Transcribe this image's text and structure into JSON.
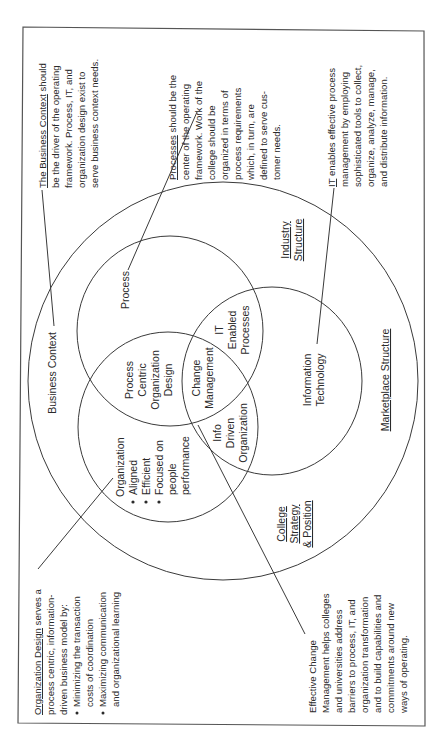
{
  "diagram": {
    "orientation": "rotated 90 degrees counter-clockwise (text reads bottom-to-top)",
    "colors": {
      "line": "#3a3a3a",
      "text": "#2a2a2a",
      "background": "#ffffff"
    },
    "regions": {
      "outer": {
        "label": "Business Context"
      },
      "process_circle": {
        "label": "Process"
      },
      "organization_circle": {
        "title": "Organization",
        "bullets": [
          "Aligned",
          "Efficient",
          "Focused on",
          "people",
          "performance"
        ]
      },
      "it_circle": {
        "line1": "Information",
        "line2": "Technology"
      },
      "process_org_overlap": {
        "lines": [
          "Process",
          "Centric",
          "Organization",
          "Design"
        ]
      },
      "process_it_overlap": {
        "lines": [
          "IT",
          "Enabled",
          "Processes"
        ]
      },
      "org_it_overlap": {
        "lines": [
          "Info",
          "Driven",
          "Organization"
        ]
      },
      "center_overlap": {
        "lines": [
          "Change",
          "Management"
        ]
      }
    },
    "outer_labels": {
      "industry": {
        "line1": "Industry",
        "line2": "Structure"
      },
      "marketplace": {
        "label": "Marketplace Structure"
      },
      "college": {
        "line1": "College",
        "line2": "Strategy",
        "line3": "& Position"
      }
    },
    "notes": {
      "business_context": {
        "keyword": "The Business Context",
        "lines": [
          " should",
          "be the driver of the operating",
          "framework. Process, IT, and",
          "organization design exist to",
          "serve business context needs."
        ]
      },
      "processes": {
        "keyword": "Processes",
        "lines": [
          " should be the",
          "center of the operating",
          "framework. Work of the",
          "college should be",
          "organized in terms of",
          "process requirements",
          "which, in turn, are",
          "defined to serve cus-",
          "tomer needs."
        ]
      },
      "it": {
        "keyword": "IT",
        "lines": [
          " enables effective process",
          "management by employing",
          "sophisticated tools to collect,",
          "organize, analyze, manage,",
          "and distribute information."
        ]
      },
      "organization_design": {
        "keyword": "Organization Design",
        "lines": [
          " serves a",
          "process centric, information-",
          "driven business model by:"
        ],
        "bullets": [
          [
            "Minimizing the transaction",
            "costs of coordination"
          ],
          [
            "Maximizing communication",
            "and organizational learning"
          ]
        ]
      },
      "change_management": {
        "lines": [
          "Effective Change",
          "Management helps colleges",
          "and universities address",
          "barriers to process, IT, and",
          "organization transformation",
          "and to build capabilities and",
          "commitments around new",
          "ways of operating."
        ]
      }
    }
  }
}
